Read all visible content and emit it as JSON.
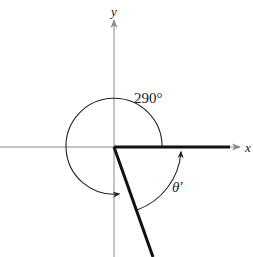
{
  "diagram": {
    "axes": {
      "x_label": "x",
      "y_label": "y"
    },
    "angle": {
      "label": "290°",
      "degrees": 290,
      "direction": "counterclockwise"
    },
    "reference_angle": {
      "label": "θ′",
      "degrees": 70
    },
    "colors": {
      "axis": "#888888",
      "ray": "#111111",
      "arc": "#222222"
    }
  }
}
